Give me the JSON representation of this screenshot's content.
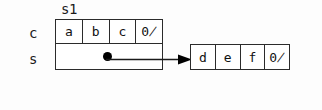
{
  "diagram": {
    "title": "",
    "colors": {
      "background": "#fdfdfd",
      "cell_fill": "#ffffff",
      "stroke": "#2b2b2b",
      "text": "#111111",
      "pointer": "#000000"
    },
    "struct_name": "s1",
    "row_labels": {
      "char_array": "c",
      "pointer": "s"
    },
    "char_array": {
      "cells": [
        "a",
        "b",
        "c",
        "0̸"
      ]
    },
    "pointer_row": {
      "dot": "pointer-dot",
      "arrow": "arrow-right"
    },
    "target_array": {
      "cells": [
        "d",
        "e",
        "f",
        "0̸"
      ]
    }
  }
}
